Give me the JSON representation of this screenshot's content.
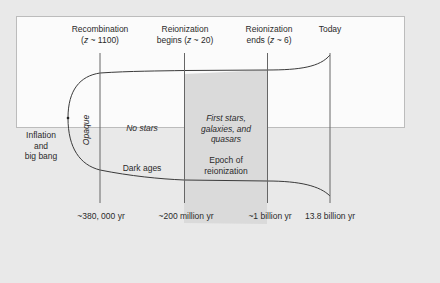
{
  "diagram": {
    "title": "",
    "milestones": [
      {
        "id": "recombination",
        "label_line1": "Recombination",
        "label_line2": "(z ~ 1100)",
        "time": "~380, 000 yr"
      },
      {
        "id": "reionization-begins",
        "label_line1": "Reionization",
        "label_line2": "begins (z ~ 20)",
        "time": "~200 million yr"
      },
      {
        "id": "reionization-ends",
        "label_line1": "Reionization",
        "label_line2": "ends (z ~ 6)",
        "time": "~1 billion yr"
      },
      {
        "id": "today",
        "label_line1": "Today",
        "label_line2": "",
        "time": "13.8 billion yr"
      }
    ],
    "start": {
      "line1": "Inflation",
      "line2": "and",
      "line3": "big bang"
    },
    "eras": {
      "opaque": "Opaque",
      "dark_ages": {
        "note": "No stars",
        "name": "Dark ages"
      },
      "reionization": {
        "note_line1": "First stars,",
        "note_line2": "galaxies, and",
        "note_line3": "quasars",
        "name_line1": "Epoch of",
        "name_line2": "reionization"
      }
    },
    "colors": {
      "background": "#e9e9e9",
      "panel": "#fbfbfb",
      "shaded_epoch": "#d9d9d9",
      "line": "#3a3a3a",
      "divider": "#5a5a5a"
    }
  }
}
